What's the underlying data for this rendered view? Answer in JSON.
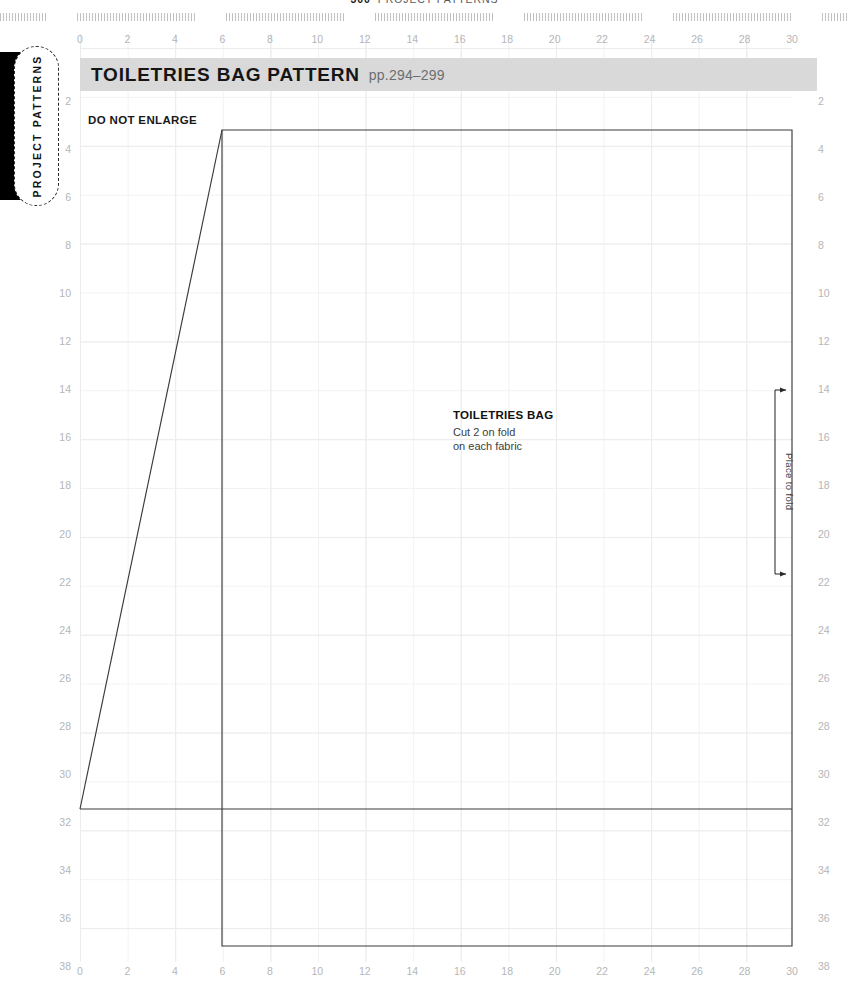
{
  "page": {
    "folio": "300",
    "running_head": "PROJECT PATTERNS",
    "background_color": "#ffffff"
  },
  "side_tab": {
    "label": "PROJECT PATTERNS",
    "block_color": "#000000",
    "border_style": "dashed"
  },
  "banner": {
    "title": "TOILETRIES BAG PATTERN",
    "pages": "pp.294–299",
    "background_color": "#d9d9d9"
  },
  "notice": {
    "do_not_enlarge": "DO NOT ENLARGE"
  },
  "piece_label": {
    "title": "TOILETRIES BAG",
    "line1": "Cut 2 on fold",
    "line2": "on each fabric"
  },
  "fold_marker": {
    "label": "Place to fold",
    "arrow_top_value": 14,
    "arrow_bottom_value": 22
  },
  "axes": {
    "tick_color": "#b4b6b8",
    "x_top": [
      0,
      2,
      4,
      6,
      8,
      10,
      12,
      14,
      16,
      18,
      20,
      22,
      24,
      26,
      28,
      30
    ],
    "x_bottom": [
      0,
      2,
      4,
      6,
      8,
      10,
      12,
      14,
      16,
      18,
      20,
      22,
      24,
      26,
      28,
      30
    ],
    "y_left": [
      2,
      4,
      6,
      8,
      10,
      12,
      14,
      16,
      18,
      20,
      22,
      24,
      26,
      28,
      30,
      32,
      34,
      36,
      38
    ],
    "y_right": [
      2,
      4,
      6,
      8,
      10,
      12,
      14,
      16,
      18,
      20,
      22,
      24,
      26,
      28,
      30,
      32,
      34,
      36,
      38
    ]
  },
  "chart_data": {
    "type": "line",
    "title": "TOILETRIES BAG PATTERN",
    "xlabel": "",
    "ylabel": "",
    "xlim": [
      0,
      30
    ],
    "ylim": [
      0,
      38
    ],
    "grid": true,
    "legend": "none",
    "series": [
      {
        "name": "pattern-outline",
        "points": [
          [
            6.0,
            2.0
          ],
          [
            30.0,
            2.0
          ],
          [
            30.0,
            37.5
          ],
          [
            6.0,
            37.5
          ],
          [
            6.0,
            2.0
          ]
        ]
      },
      {
        "name": "side-taper",
        "points": [
          [
            6.0,
            2.0
          ],
          [
            0.0,
            31.7
          ]
        ]
      },
      {
        "name": "base-extension",
        "points": [
          [
            0.0,
            31.7
          ],
          [
            30.0,
            31.7
          ]
        ]
      },
      {
        "name": "fold-arrow",
        "points": [
          [
            29.5,
            14.0
          ],
          [
            29.5,
            22.0
          ]
        ]
      }
    ]
  }
}
